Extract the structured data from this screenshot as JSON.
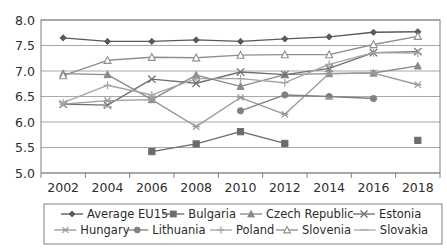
{
  "chart_data": {
    "type": "line",
    "title": "",
    "subtitle": "",
    "xlabel": "",
    "ylabel": "",
    "x": [
      2002,
      2004,
      2006,
      2008,
      2010,
      2012,
      2014,
      2016,
      2018
    ],
    "xticklabels": [
      "2002",
      "2004",
      "2006",
      "2008",
      "2010",
      "2012",
      "2014",
      "2016",
      "2018"
    ],
    "yticklabels": [
      "5.0",
      "5.5",
      "6.0",
      "6.5",
      "7.0",
      "7.5",
      "8.0"
    ],
    "yticks": [
      5.0,
      5.5,
      6.0,
      6.5,
      7.0,
      7.5,
      8.0
    ],
    "ylim": [
      5.0,
      8.0
    ],
    "xlim": [
      2002,
      2018
    ],
    "grid": "horizontal",
    "legend_position": "bottom",
    "legend_columns": 5,
    "series": [
      {
        "name": "Average EU15",
        "marker": "diamond",
        "color": "#595959",
        "values": [
          7.65,
          7.58,
          7.58,
          7.61,
          7.58,
          7.63,
          7.67,
          7.76,
          7.77
        ]
      },
      {
        "name": "Bulgaria",
        "marker": "square",
        "color": "#6b6b6b",
        "values": [
          null,
          null,
          5.42,
          5.57,
          5.81,
          5.58,
          null,
          null,
          5.64
        ]
      },
      {
        "name": "Czech Republic",
        "marker": "triangle",
        "color": "#8a8a8a",
        "values": [
          6.95,
          6.93,
          6.44,
          6.92,
          6.7,
          6.93,
          6.95,
          6.96,
          7.1
        ]
      },
      {
        "name": "Estonia",
        "marker": "cross-x",
        "color": "#707070",
        "values": [
          6.35,
          6.33,
          6.84,
          6.76,
          6.98,
          6.93,
          7.05,
          7.36,
          7.38
        ]
      },
      {
        "name": "Hungary",
        "marker": "asterisk",
        "color": "#9a9a9a",
        "values": [
          6.35,
          6.42,
          6.44,
          5.91,
          6.48,
          6.15,
          6.95,
          6.96,
          6.73
        ]
      },
      {
        "name": "Lithuania",
        "marker": "circle",
        "color": "#808080",
        "values": [
          null,
          null,
          null,
          null,
          6.22,
          6.53,
          6.5,
          6.46,
          null
        ]
      },
      {
        "name": "Poland",
        "marker": "plus",
        "color": "#a5a5a5",
        "values": [
          6.38,
          6.72,
          6.53,
          6.85,
          6.85,
          6.77,
          7.13,
          7.36,
          7.35
        ]
      },
      {
        "name": "Slovenia",
        "marker": "triangle-open",
        "color": "#8f8f8f",
        "values": [
          6.91,
          7.21,
          7.27,
          7.26,
          7.31,
          7.32,
          7.32,
          7.52,
          7.68
        ]
      },
      {
        "name": "Slovakia",
        "marker": "dash",
        "color": "#b0b0b0",
        "values": [
          null,
          6.3,
          null,
          null,
          null,
          null,
          6.45,
          null,
          null
        ]
      }
    ]
  },
  "legend": {
    "items": [
      {
        "label": "Average EU15",
        "marker": "diamond"
      },
      {
        "label": "Bulgaria",
        "marker": "square"
      },
      {
        "label": "Czech Republic",
        "marker": "triangle"
      },
      {
        "label": "Estonia",
        "marker": "cross-x"
      },
      {
        "label": "Hungary",
        "marker": "asterisk"
      },
      {
        "label": "Lithuania",
        "marker": "circle"
      },
      {
        "label": "Poland",
        "marker": "plus"
      },
      {
        "label": "Slovenia",
        "marker": "triangle-open"
      },
      {
        "label": "Slovakia",
        "marker": "dash"
      }
    ]
  },
  "colors": {
    "plot_border": "#808080",
    "gridline": "#9e9e9e",
    "axis_text": "#2e2e2e",
    "background": "#ffffff",
    "legend_border": "#808080"
  }
}
